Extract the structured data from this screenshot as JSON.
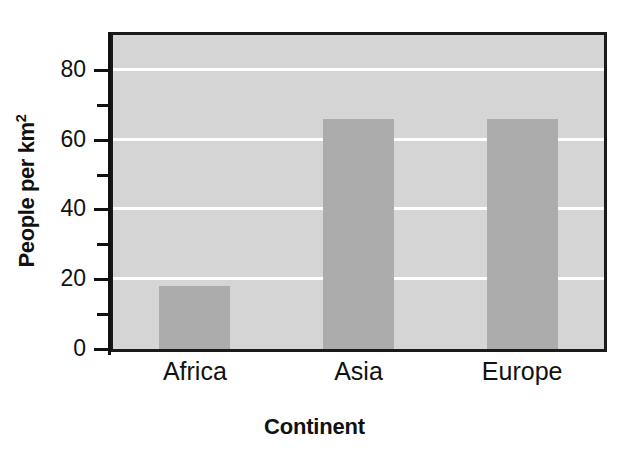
{
  "chart_data": {
    "type": "bar",
    "title": "",
    "categories": [
      "Africa",
      "Asia",
      "Europe"
    ],
    "values": [
      18,
      66,
      66
    ],
    "series": [
      {
        "name": "Population density",
        "values": [
          18,
          66,
          66
        ]
      }
    ],
    "xlabel": "Continent",
    "ylabel": "People per km²",
    "ylabel_base": "People per km",
    "ylabel_superscript": "2",
    "ylim": [
      0,
      90
    ],
    "y_major_ticks": [
      0,
      20,
      40,
      60,
      80
    ],
    "y_minor_ticks": [
      10,
      30,
      50,
      70
    ],
    "y_tick_labels": [
      "0",
      "20",
      "40",
      "60",
      "80"
    ],
    "grid": "horizontal-white",
    "gridline_values": [
      20,
      40,
      60,
      80
    ],
    "legend": "none",
    "colors": {
      "bar_fill": "#acacac",
      "plot_background": "#d5d5d5",
      "gridline": "#ffffff",
      "axis": "#111111",
      "frame": "#1a1a1a",
      "text": "#111111",
      "page_background": "#ffffff"
    }
  },
  "figure": {
    "title_remnant": "",
    "y_tick_labels": {
      "t0": "0",
      "t20": "20",
      "t40": "40",
      "t60": "60",
      "t80": "80"
    },
    "x_tick_labels": {
      "c0": "Africa",
      "c1": "Asia",
      "c2": "Europe"
    },
    "axis_titles": {
      "x": "Continent",
      "y_base": "People per km",
      "y_sup": "2"
    }
  }
}
